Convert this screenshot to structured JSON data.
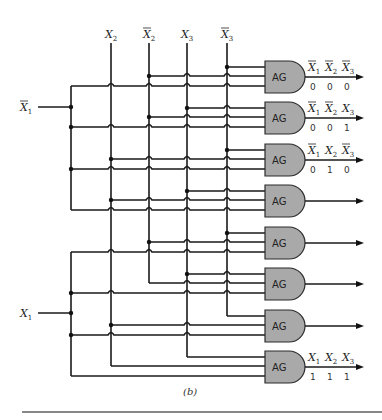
{
  "diagram": {
    "caption": "(b)",
    "gate_label": "AG",
    "inputs": {
      "left": [
        {
          "id": "nX1",
          "name": "X",
          "sub": "1",
          "bar": true
        },
        {
          "id": "X1",
          "name": "X",
          "sub": "1",
          "bar": false
        }
      ],
      "top": [
        {
          "id": "X2",
          "name": "X",
          "sub": "2",
          "bar": false
        },
        {
          "id": "nX2",
          "name": "X",
          "sub": "2",
          "bar": true
        },
        {
          "id": "X3",
          "name": "X",
          "sub": "3",
          "bar": false
        },
        {
          "id": "nX3",
          "name": "X",
          "sub": "3",
          "bar": true
        }
      ]
    },
    "gates": [
      {
        "index": 0,
        "inputs": [
          "nX3",
          "nX2",
          "nX1"
        ],
        "output_label": [
          {
            "sub": "1",
            "bar": true
          },
          {
            "sub": "2",
            "bar": true
          },
          {
            "sub": "3",
            "bar": true
          }
        ],
        "bits": [
          "0",
          "0",
          "0"
        ]
      },
      {
        "index": 1,
        "inputs": [
          "X3",
          "nX2",
          "nX1"
        ],
        "output_label": [
          {
            "sub": "1",
            "bar": true
          },
          {
            "sub": "2",
            "bar": true
          },
          {
            "sub": "3",
            "bar": false
          }
        ],
        "bits": [
          "0",
          "0",
          "1"
        ]
      },
      {
        "index": 2,
        "inputs": [
          "nX3",
          "X2",
          "nX1"
        ],
        "output_label": [
          {
            "sub": "1",
            "bar": true
          },
          {
            "sub": "2",
            "bar": false
          },
          {
            "sub": "3",
            "bar": true
          }
        ],
        "bits": [
          "0",
          "1",
          "0"
        ]
      },
      {
        "index": 3,
        "inputs": [
          "X3",
          "X2",
          "nX1"
        ],
        "output_label": null,
        "bits": null
      },
      {
        "index": 4,
        "inputs": [
          "nX3",
          "nX2",
          "X1"
        ],
        "output_label": null,
        "bits": null
      },
      {
        "index": 5,
        "inputs": [
          "X3",
          "nX2",
          "X1"
        ],
        "output_label": null,
        "bits": null
      },
      {
        "index": 6,
        "inputs": [
          "nX3",
          "X2",
          "X1"
        ],
        "output_label": null,
        "bits": null
      },
      {
        "index": 7,
        "inputs": [
          "X3",
          "X2",
          "X1"
        ],
        "output_label": [
          {
            "sub": "1",
            "bar": false
          },
          {
            "sub": "2",
            "bar": false
          },
          {
            "sub": "3",
            "bar": false
          }
        ],
        "bits": [
          "1",
          "1",
          "1"
        ]
      }
    ]
  },
  "colors": {
    "gate_fill": "#a9a9a9",
    "wire": "#1a1a1a",
    "background": "#ffffff"
  }
}
